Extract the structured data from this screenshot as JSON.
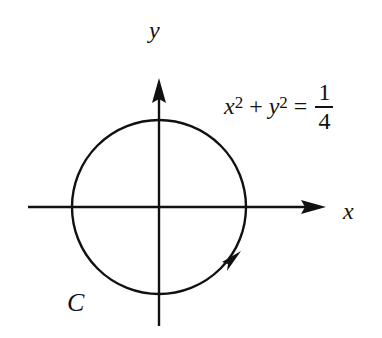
{
  "diagram": {
    "type": "coordinate-plane-with-circle",
    "axes": {
      "x_label": "x",
      "y_label": "y"
    },
    "curve": {
      "name": "C",
      "equation": {
        "lhs_var1": "x",
        "lhs_exp1": "2",
        "plus": "+",
        "lhs_var2": "y",
        "lhs_exp2": "2",
        "equals": "=",
        "rhs_numerator": "1",
        "rhs_denominator": "4"
      },
      "orientation": "counterclockwise",
      "radius": "1/2"
    },
    "colors": {
      "stroke": "#111111",
      "background": "#ffffff"
    }
  }
}
